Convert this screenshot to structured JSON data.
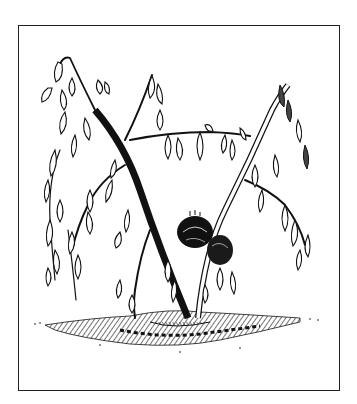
{
  "illustration": {
    "subject": "wilting plant with drooping leaves and dark fruit",
    "style": "black and white pen-and-ink line drawing",
    "colors": {
      "ink": "#111111",
      "paper": "#ffffff",
      "frame": "#222222"
    }
  }
}
